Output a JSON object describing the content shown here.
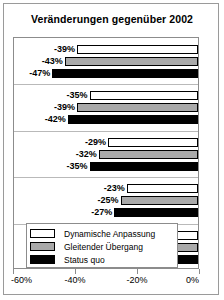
{
  "chart": {
    "title": "Veränderungen gegenüber 2002"
  },
  "chart_data": {
    "type": "bar",
    "orientation": "horizontal",
    "title": "Veränderungen gegenüber 2002",
    "xlabel": "",
    "ylabel": "",
    "xlim": [
      -60,
      0
    ],
    "xticks": [
      -60,
      -40,
      -20,
      0
    ],
    "xticklabels": [
      "-60%",
      "-40%",
      "-20%",
      "0%"
    ],
    "grid": false,
    "legend_position": "bottom-left",
    "categories": [
      "Gruppe 1",
      "Gruppe 2",
      "Gruppe 3",
      "Gruppe 4",
      "Gruppe 5"
    ],
    "series": [
      {
        "name": "Dynamische Anpassung",
        "color": "#ffffff",
        "values": [
          -39,
          -35,
          -29,
          -23,
          -15
        ],
        "labels": [
          "-39%",
          "-35%",
          "-29%",
          "-23%",
          "-15%"
        ]
      },
      {
        "name": "Gleitender Übergang",
        "color": "#a9a9a9",
        "values": [
          -43,
          -39,
          -32,
          -25,
          -16
        ],
        "labels": [
          "-43%",
          "-39%",
          "-32%",
          "-25%",
          "-16%"
        ]
      },
      {
        "name": "Status quo",
        "color": "#000000",
        "values": [
          -47,
          -42,
          -35,
          -27,
          -17
        ],
        "labels": [
          "-47%",
          "-42%",
          "-35%",
          "-27%",
          "17%"
        ]
      }
    ]
  },
  "legend": {
    "items": [
      {
        "label": "Dynamische Anpassung",
        "color": "#ffffff"
      },
      {
        "label": "Gleitender Übergang",
        "color": "#a9a9a9"
      },
      {
        "label": "Status quo",
        "color": "#000000"
      }
    ]
  },
  "axis": {
    "ticks": [
      {
        "label": "-60%",
        "value": -60
      },
      {
        "label": "-40%",
        "value": -40
      },
      {
        "label": "-20%",
        "value": -20
      },
      {
        "label": "0%",
        "value": 0
      }
    ]
  }
}
